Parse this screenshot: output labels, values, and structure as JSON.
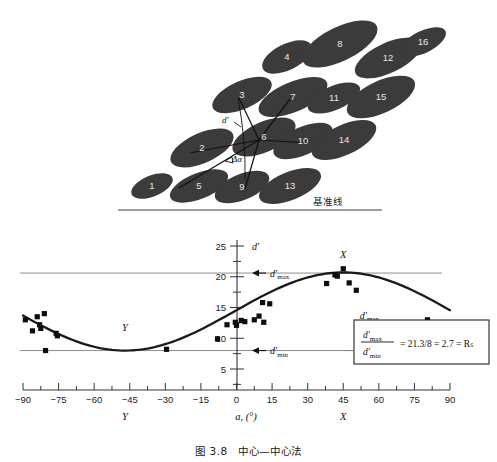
{
  "figure": {
    "caption": "图 3.8　中心—中心法",
    "baseline_label": "基准线",
    "diagram": {
      "d_prime_label": "d′",
      "delta_alpha_label": "Δα",
      "ellipses": [
        {
          "n": "1",
          "cx": 152,
          "cy": 186,
          "rx": 22,
          "ry": 10.5,
          "rot": -22
        },
        {
          "n": "2",
          "cx": 202,
          "cy": 148,
          "rx": 34,
          "ry": 15,
          "rot": -24
        },
        {
          "n": "3",
          "cx": 242,
          "cy": 95,
          "rx": 32,
          "ry": 14,
          "rot": -24
        },
        {
          "n": "4",
          "cx": 287,
          "cy": 57,
          "rx": 27,
          "ry": 13,
          "rot": -26
        },
        {
          "n": "5",
          "cx": 199,
          "cy": 186,
          "rx": 31,
          "ry": 13,
          "rot": -22
        },
        {
          "n": "6",
          "cx": 264,
          "cy": 137,
          "rx": 34,
          "ry": 15,
          "rot": -24
        },
        {
          "n": "7",
          "cx": 293,
          "cy": 97,
          "rx": 37,
          "ry": 15,
          "rot": -23
        },
        {
          "n": "8",
          "cx": 340,
          "cy": 44,
          "rx": 41,
          "ry": 17,
          "rot": -26
        },
        {
          "n": "9",
          "cx": 242,
          "cy": 187,
          "rx": 29,
          "ry": 13,
          "rot": -22
        },
        {
          "n": "10",
          "cx": 303,
          "cy": 141,
          "rx": 32,
          "ry": 14,
          "rot": -24
        },
        {
          "n": "11",
          "cx": 334,
          "cy": 98,
          "rx": 28,
          "ry": 12,
          "rot": -23
        },
        {
          "n": "12",
          "cx": 388,
          "cy": 58,
          "rx": 36,
          "ry": 15,
          "rot": -25
        },
        {
          "n": "13",
          "cx": 290,
          "cy": 186,
          "rx": 33,
          "ry": 14,
          "rot": -22
        },
        {
          "n": "14",
          "cx": 344,
          "cy": 140,
          "rx": 35,
          "ry": 15,
          "rot": -25
        },
        {
          "n": "15",
          "cx": 381,
          "cy": 97,
          "rx": 37,
          "ry": 16,
          "rot": -25
        },
        {
          "n": "16",
          "cx": 423,
          "cy": 42,
          "rx": 25,
          "ry": 11,
          "rot": -26
        }
      ]
    }
  },
  "chart_data": {
    "type": "scatter",
    "title": "",
    "xlabel": "a, (°)",
    "ylabel": "d′",
    "xlim": [
      -90,
      90
    ],
    "ylim": [
      0,
      26
    ],
    "xticks": [
      -90,
      -75,
      -60,
      -45,
      -30,
      -15,
      0,
      15,
      30,
      45,
      60,
      75,
      90
    ],
    "xticklabels": [
      "−90",
      "−75",
      "−60",
      "−45",
      "−30",
      "−15",
      "0",
      "15",
      "30",
      "45",
      "60",
      "75",
      "90"
    ],
    "yticks": [
      5,
      10,
      15,
      20,
      25
    ],
    "yticklabels": [
      "5",
      "10",
      "15",
      "20",
      "25"
    ],
    "grid": false,
    "series": [
      {
        "name": "measured d′",
        "type": "scatter",
        "marker": "square",
        "points": [
          [
            -89.0,
            13.0
          ],
          [
            -86.0,
            11.2
          ],
          [
            -84.0,
            13.5
          ],
          [
            -83.0,
            12.2
          ],
          [
            -82.5,
            11.6
          ],
          [
            -81.0,
            14.0
          ],
          [
            -80.5,
            8.0
          ],
          [
            -76.0,
            10.8
          ],
          [
            -75.5,
            10.4
          ],
          [
            -29.5,
            8.2
          ],
          [
            -8.0,
            9.9
          ],
          [
            -4.0,
            12.2
          ],
          [
            -0.5,
            12.6
          ],
          [
            0.0,
            12.1
          ],
          [
            2.0,
            12.9
          ],
          [
            3.5,
            12.7
          ],
          [
            7.5,
            13.0
          ],
          [
            9.5,
            13.6
          ],
          [
            11.0,
            15.8
          ],
          [
            11.5,
            12.6
          ],
          [
            14.0,
            15.6
          ],
          [
            38.0,
            18.9
          ],
          [
            41.5,
            20.3
          ],
          [
            42.5,
            20.1
          ],
          [
            45.0,
            21.3
          ],
          [
            47.5,
            19.0
          ],
          [
            50.5,
            17.8
          ],
          [
            80.5,
            13.0
          ]
        ]
      },
      {
        "name": "fitted sinusoid",
        "type": "line",
        "description": "smooth fitted curve through d′ data"
      }
    ],
    "reference_lines": [
      {
        "label": "d′max",
        "value": 20.6,
        "orientation": "horizontal"
      },
      {
        "label": "d′min",
        "value": 8.0,
        "orientation": "horizontal"
      }
    ],
    "annotations": [
      {
        "text": "X",
        "x": 45,
        "y": 23.2,
        "note": "peak marker above curve"
      },
      {
        "text": "Y",
        "x": -47,
        "y": 11.1,
        "note": "trough marker above curve"
      },
      {
        "text": "X",
        "axis": "x",
        "value": 45,
        "note": "x axis region label"
      },
      {
        "text": "Y",
        "axis": "x",
        "value": -47,
        "note": "x axis region label"
      },
      {
        "text": "d′max",
        "x": 57,
        "y": 13.2
      }
    ],
    "formula": {
      "numerator": "d′max",
      "denominator": "d′min",
      "rhs": "= 21.3/8 = 2.7 = Rₛ",
      "numerator_value": 21.3,
      "denominator_value": 8,
      "ratio": 2.7,
      "symbol": "Rₛ"
    },
    "axis_labels": {
      "y_axis_symbol": "d′",
      "x_axis_caption": "a, (°)",
      "dmax_arrow_label": "d′max",
      "dmin_arrow_label": "d′min"
    }
  }
}
